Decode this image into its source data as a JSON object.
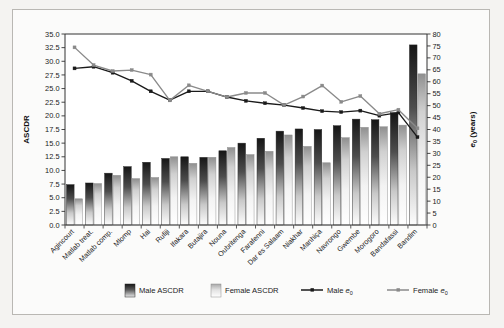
{
  "chart_data": {
    "type": "bar",
    "title": "",
    "xlabel": "",
    "ylabel": "ASCDR",
    "y2label": "e₀ (years)",
    "ylim": [
      0,
      35
    ],
    "y2lim": [
      0,
      80
    ],
    "ytick_step": 2.5,
    "y2tick_step": 5,
    "grid": false,
    "legend_position": "bottom",
    "categories": [
      "Agincourt",
      "Matlab treat.",
      "Matlab comp.",
      "Mlomp",
      "Hai",
      "Rufiji",
      "Ifakara",
      "Butajira",
      "Nouna",
      "Oubritenga",
      "Farafenni",
      "Dar es Salaam",
      "Niakhar",
      "Manhiça",
      "Navrongo",
      "Gwembe",
      "Morogoro",
      "Bandafassi",
      "Bandim"
    ],
    "yticks": [
      "0.0",
      "2.5",
      "5.0",
      "7.5",
      "10.0",
      "12.5",
      "15.0",
      "17.5",
      "20.0",
      "22.5",
      "25.0",
      "27.5",
      "30.0",
      "32.5",
      "35.0"
    ],
    "y2ticks": [
      "0",
      "5",
      "10",
      "15",
      "20",
      "25",
      "30",
      "35",
      "40",
      "45",
      "50",
      "55",
      "60",
      "65",
      "70",
      "75",
      "80"
    ],
    "series": [
      {
        "name": "Male ASCDR",
        "kind": "bar",
        "axis": "left",
        "color": "#1c1c1c",
        "values": [
          7.4,
          7.7,
          9.5,
          10.7,
          11.5,
          12.2,
          12.5,
          12.4,
          13.6,
          15.0,
          15.9,
          17.2,
          17.6,
          17.5,
          18.2,
          19.4,
          19.3,
          20.6,
          33.0
        ]
      },
      {
        "name": "Female ASCDR",
        "kind": "bar",
        "axis": "left",
        "color": "#ffffff",
        "values": [
          4.8,
          7.6,
          9.1,
          8.5,
          8.7,
          12.5,
          11.3,
          12.4,
          14.2,
          12.9,
          13.5,
          16.5,
          14.4,
          11.4,
          16.0,
          17.9,
          18.0,
          18.3,
          27.7
        ]
      },
      {
        "name": "Male e₀",
        "kind": "line",
        "axis": "right",
        "color": "#1a1a1a",
        "values": [
          65.6,
          66.3,
          63.8,
          60.4,
          56.0,
          52.3,
          56.0,
          56.0,
          53.6,
          52.0,
          51.0,
          50.2,
          49.0,
          47.7,
          47.3,
          47.9,
          45.8,
          47.1,
          36.8
        ]
      },
      {
        "name": "Female e₀",
        "kind": "line",
        "axis": "right",
        "color": "#8a8a8a",
        "values": [
          74.4,
          67.0,
          64.5,
          64.9,
          63.0,
          52.2,
          58.5,
          56.0,
          53.6,
          55.3,
          55.3,
          50.2,
          53.8,
          58.4,
          51.6,
          54.0,
          46.6,
          48.3,
          40.5
        ]
      }
    ],
    "legend_entries": [
      {
        "label": "Male ASCDR",
        "marker": "bar-dark"
      },
      {
        "label": "Female ASCDR",
        "marker": "bar-light"
      },
      {
        "label": "Male e₀",
        "marker": "line-dark"
      },
      {
        "label": "Female e₀",
        "marker": "line-grey"
      }
    ]
  }
}
